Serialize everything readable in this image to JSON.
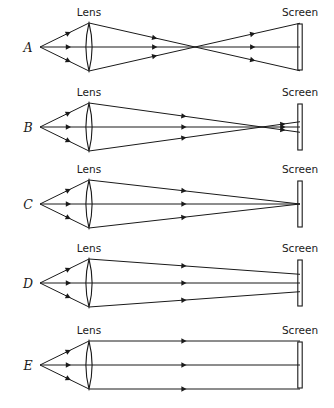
{
  "figure": {
    "background_color": "#ffffff",
    "ink_color": "#1a1a1a",
    "width": 334,
    "height": 408
  },
  "geometry": {
    "source_x": 40,
    "lens_x": 89,
    "lens_half_height": 24,
    "screen_x": 300,
    "screen_half_height": 23,
    "row_axis_y": [
      47,
      127,
      204,
      283,
      365
    ],
    "label_x": 28,
    "lens_label_x": 89,
    "screen_label_x": 300
  },
  "labels": {
    "lens": "Lens",
    "screen": "Screen"
  },
  "panels": [
    {
      "id": "A",
      "label": "A",
      "axis_y": 47,
      "lens_label": "Lens",
      "screen_label": "Screen",
      "converge_x": 195,
      "screen_spread": 21,
      "focus_state": "crosses-well-before-screen",
      "description": "Rays converge to a point midway between lens and screen, then diverge widely onto the screen"
    },
    {
      "id": "B",
      "label": "B",
      "axis_y": 127,
      "lens_label": "Lens",
      "screen_label": "Screen",
      "converge_x": 262,
      "screen_spread": 9,
      "focus_state": "crosses-just-before-screen",
      "description": "Rays converge just before the screen, then diverge slightly onto the screen"
    },
    {
      "id": "C",
      "label": "C",
      "axis_y": 204,
      "lens_label": "Lens",
      "screen_label": "Screen",
      "converge_x": 300,
      "screen_spread": 0,
      "focus_state": "focused-at-screen",
      "description": "Rays converge exactly at the screen forming a sharp point"
    },
    {
      "id": "D",
      "label": "D",
      "axis_y": 283,
      "lens_label": "Lens",
      "screen_label": "Screen",
      "converge_x": 420,
      "screen_spread": 13,
      "focus_state": "converging-not-yet-focused",
      "description": "Rays are still converging when they reach the screen; focus lies beyond it"
    },
    {
      "id": "E",
      "label": "E",
      "axis_y": 365,
      "lens_label": "Lens",
      "screen_label": "Screen",
      "converge_x": null,
      "screen_spread": 24,
      "focus_state": "parallel-after-lens",
      "description": "Rays emerge parallel from the lens and stay parallel to the screen"
    }
  ]
}
